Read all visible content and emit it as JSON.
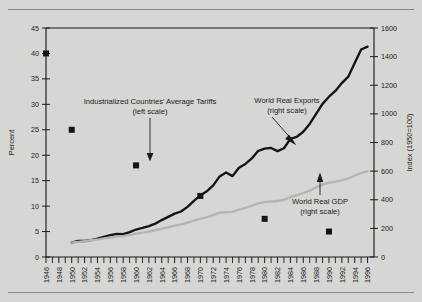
{
  "figure": {
    "background_color": "#d6d6d4",
    "has_top_rule": true,
    "has_bottom_rule": true
  },
  "chart_data": {
    "type": "line",
    "title": "",
    "xlabel": "",
    "ylabel": "Percent",
    "y2label": "Index (1950=100)",
    "grid": false,
    "legend": "annotations",
    "xlim": [
      1946,
      1997
    ],
    "ylim": [
      0,
      45
    ],
    "y2lim": [
      0,
      1600
    ],
    "yticks": [
      0,
      5,
      10,
      15,
      20,
      25,
      30,
      35,
      40,
      45
    ],
    "y2ticks": [
      0,
      200,
      400,
      600,
      800,
      1000,
      1200,
      1400,
      1600
    ],
    "xticks": [
      1946,
      1948,
      1950,
      1952,
      1954,
      1956,
      1958,
      1960,
      1962,
      1964,
      1966,
      1968,
      1970,
      1972,
      1974,
      1976,
      1978,
      1980,
      1982,
      1984,
      1986,
      1988,
      1990,
      1992,
      1994,
      1996
    ],
    "xtick_minor_every": 1,
    "series": [
      {
        "name": "World Real Exports",
        "scale": "right",
        "style": "line",
        "color": "#141414",
        "x": [
          1950,
          1951,
          1952,
          1953,
          1954,
          1955,
          1956,
          1957,
          1958,
          1959,
          1960,
          1961,
          1962,
          1963,
          1964,
          1965,
          1966,
          1967,
          1968,
          1969,
          1970,
          1971,
          1972,
          1973,
          1974,
          1975,
          1976,
          1977,
          1978,
          1979,
          1980,
          1981,
          1982,
          1983,
          1984,
          1985,
          1986,
          1987,
          1988,
          1989,
          1990,
          1991,
          1992,
          1993,
          1994,
          1995,
          1996
        ],
        "values": [
          100,
          112,
          112,
          118,
          128,
          140,
          152,
          161,
          160,
          174,
          192,
          203,
          216,
          233,
          258,
          280,
          303,
          318,
          350,
          392,
          430,
          459,
          500,
          563,
          590,
          565,
          623,
          650,
          689,
          742,
          757,
          762,
          740,
          760,
          825,
          840,
          875,
          930,
          1000,
          1070,
          1120,
          1160,
          1215,
          1260,
          1355,
          1450,
          1470
        ]
      },
      {
        "name": "World Real GDP",
        "scale": "right",
        "style": "line",
        "color": "#b4b4b2",
        "x": [
          1950,
          1951,
          1952,
          1953,
          1954,
          1955,
          1956,
          1957,
          1958,
          1959,
          1960,
          1961,
          1962,
          1963,
          1964,
          1965,
          1966,
          1967,
          1968,
          1969,
          1970,
          1971,
          1972,
          1973,
          1974,
          1975,
          1976,
          1977,
          1978,
          1979,
          1980,
          1981,
          1982,
          1983,
          1984,
          1985,
          1986,
          1987,
          1988,
          1989,
          1990,
          1991,
          1992,
          1993,
          1994,
          1995,
          1996
        ],
        "values": [
          100,
          106,
          111,
          117,
          122,
          130,
          136,
          142,
          146,
          154,
          163,
          170,
          178,
          187,
          198,
          208,
          219,
          228,
          241,
          255,
          267,
          278,
          292,
          309,
          314,
          315,
          331,
          344,
          359,
          375,
          383,
          389,
          391,
          400,
          418,
          432,
          446,
          464,
          487,
          506,
          520,
          526,
          535,
          547,
          568,
          587,
          600
        ]
      },
      {
        "name": "Industrialized Countries' Average Tariffs",
        "scale": "left",
        "style": "markers",
        "color": "#141414",
        "x": [
          1946,
          1950,
          1960,
          1970,
          1980,
          1990
        ],
        "values": [
          40,
          25,
          18,
          12,
          7.5,
          5
        ]
      }
    ],
    "annotations": [
      {
        "id": "tariffs",
        "line1": "Industrialized Countries' Average Tariffs",
        "line2": "(left scale)",
        "pointer": "line-down"
      },
      {
        "id": "exports",
        "line1": "World Real Exports",
        "line2": "(right scale)",
        "pointer": "arrow-down-right"
      },
      {
        "id": "gdp",
        "line1": "World Real GDP",
        "line2": "(right scale)",
        "pointer": "arrow-up"
      }
    ]
  },
  "axes": {
    "left_title": "Percent",
    "right_title": "Index (1950=100)",
    "left_ticks": [
      "45",
      "40",
      "35",
      "30",
      "25",
      "20",
      "15",
      "10",
      "5",
      "0"
    ],
    "right_ticks": [
      "1600",
      "1400",
      "1200",
      "1000",
      "800",
      "600",
      "400",
      "200",
      "0"
    ],
    "x_ticks": [
      "1946",
      "1948",
      "1950",
      "1952",
      "1954",
      "1956",
      "1958",
      "1960",
      "1962",
      "1964",
      "1966",
      "1968",
      "1970",
      "1972",
      "1974",
      "1976",
      "1978",
      "1980",
      "1982",
      "1984",
      "1986",
      "1988",
      "1990",
      "1992",
      "1994",
      "1996"
    ]
  }
}
